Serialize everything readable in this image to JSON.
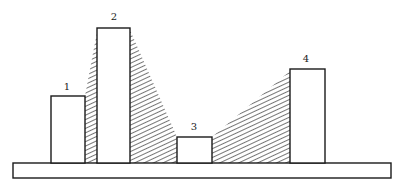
{
  "diagram": {
    "colors": {
      "ink": "#1a1a1a",
      "background": "#ffffff"
    },
    "base": {
      "x": 13,
      "y": 163,
      "width": 378,
      "height": 15
    },
    "blocks": [
      {
        "label": "1",
        "x": 51,
        "y": 96,
        "width": 34,
        "height": 67,
        "label_x": 67,
        "label_y": 90
      },
      {
        "label": "2",
        "x": 97,
        "y": 28,
        "width": 33,
        "height": 135,
        "label_x": 114,
        "label_y": 20
      },
      {
        "label": "3",
        "x": 177,
        "y": 137,
        "width": 35,
        "height": 26,
        "label_x": 194,
        "label_y": 130
      },
      {
        "label": "4",
        "x": 290,
        "y": 69,
        "width": 35,
        "height": 94,
        "label_x": 306,
        "label_y": 62
      }
    ],
    "hatched_regions": [
      {
        "name": "hatch-between-1-and-2",
        "points": "85,163 85,96 97,32 97,163"
      },
      {
        "name": "hatch-between-2-and-3",
        "points": "130,163 130,30 177,137 177,163"
      },
      {
        "name": "hatch-between-3-and-4",
        "points": "212,163 212,137 290,71 290,163"
      }
    ]
  }
}
